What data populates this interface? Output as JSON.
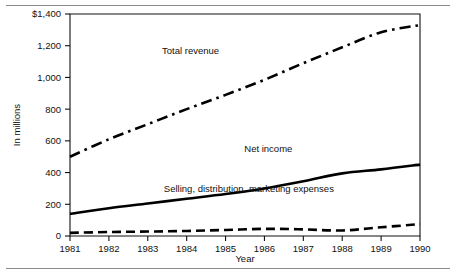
{
  "chart_data": {
    "type": "line",
    "title": "",
    "xlabel": "Year",
    "ylabel": "In millions",
    "x": [
      1981,
      1982,
      1983,
      1984,
      1985,
      1986,
      1987,
      1988,
      1989,
      1990
    ],
    "categories": [
      "1981",
      "1982",
      "1983",
      "1984",
      "1985",
      "1986",
      "1987",
      "1988",
      "1989",
      "1990"
    ],
    "xlim": [
      1981,
      1990
    ],
    "ylim": [
      0,
      1400
    ],
    "ytick_labels": [
      "$1,400",
      "1,200",
      "1,000",
      "800",
      "600",
      "400",
      "200",
      "0"
    ],
    "ytick_values": [
      1400,
      1200,
      1000,
      800,
      600,
      400,
      200,
      0
    ],
    "grid": false,
    "legend_position": "inline-annotations",
    "series": [
      {
        "name": "Total revenue",
        "style": "dash-dot",
        "color": "#000000",
        "values": [
          500,
          610,
          705,
          800,
          890,
          985,
          1090,
          1190,
          1285,
          1330
        ]
      },
      {
        "name": "Net income",
        "style": "solid",
        "color": "#000000",
        "values": [
          140,
          175,
          205,
          235,
          265,
          300,
          345,
          395,
          420,
          450
        ]
      },
      {
        "name": "Selling, distribution, marketing expenses",
        "style": "dashed",
        "color": "#000000",
        "values": [
          20,
          25,
          28,
          32,
          38,
          45,
          42,
          35,
          55,
          75
        ]
      }
    ],
    "annotations": [
      {
        "text": "Total revenue",
        "x": 1984.1,
        "y": 1145
      },
      {
        "text": "Net income",
        "x": 1986.1,
        "y": 530
      },
      {
        "text": "Selling, distribution, marketing expenses",
        "x": 1985.6,
        "y": 280
      }
    ]
  },
  "axes": {
    "y_axis_title": "In millions",
    "x_axis_title": "Year"
  }
}
